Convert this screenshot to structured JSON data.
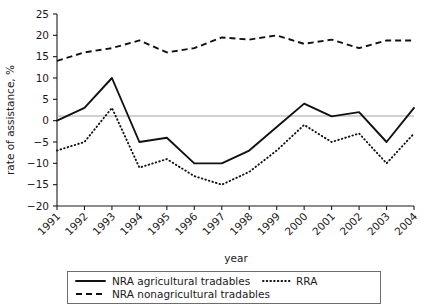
{
  "chart_data": {
    "type": "line",
    "title": "",
    "xlabel": "year",
    "ylabel": "rate of assistance, %",
    "x": [
      1991,
      1992,
      1993,
      1994,
      1995,
      1996,
      1997,
      1998,
      1999,
      2000,
      2001,
      2002,
      2003,
      2004
    ],
    "categories": [
      "1991",
      "1992",
      "1993",
      "1994",
      "1995",
      "1996",
      "1997",
      "1998",
      "1999",
      "2000",
      "2001",
      "2002",
      "2003",
      "2004"
    ],
    "ylim": [
      -20,
      25
    ],
    "yticks": [
      -20,
      -15,
      -10,
      -5,
      0,
      5,
      10,
      15,
      20,
      25
    ],
    "ytick_labels": [
      "−20",
      "−15",
      "−10",
      "−5",
      "0",
      "5",
      "10",
      "15",
      "20",
      "25"
    ],
    "grid": false,
    "zero_line": true,
    "legend_position": "bottom",
    "series": [
      {
        "name": "NRA agricultural tradables",
        "style": "solid",
        "values": [
          0,
          3,
          10,
          -5,
          -4,
          -10,
          -10,
          -7,
          -1.5,
          4,
          1,
          2,
          -5,
          3
        ]
      },
      {
        "name": "NRA nonagricultural tradables",
        "style": "dashed",
        "values": [
          14,
          16,
          17,
          18.8,
          16,
          17,
          19.5,
          19,
          20,
          18,
          19,
          17,
          18.8,
          18.8
        ]
      },
      {
        "name": "RRA",
        "style": "dotted",
        "values": [
          -7,
          -5,
          3,
          -11,
          -9,
          -13,
          -15,
          -12,
          -7,
          -1,
          -5,
          -3,
          -10,
          -3
        ]
      }
    ]
  },
  "axes": {
    "y_label": "rate of assistance, %",
    "x_label": "year"
  },
  "legend": {
    "items": [
      {
        "label": "NRA agricultural tradables",
        "style": "solid"
      },
      {
        "label": "RRA",
        "style": "dotted"
      },
      {
        "label": "NRA nonagricultural tradables",
        "style": "dashed"
      }
    ]
  },
  "colors": {
    "ink": "#111111",
    "axis": "#1a1a1a",
    "zero_line": "#9a9a9a",
    "legend_border": "#6d6d6d",
    "background": "#ffffff"
  }
}
